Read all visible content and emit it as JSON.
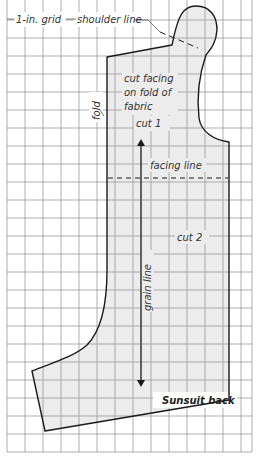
{
  "title": "Sunsuit back",
  "grid": {
    "label": "1-in. grid",
    "spacing_px": 18,
    "line_color": "#9a9a9a",
    "paper_color": "#ffffff"
  },
  "pattern_piece": {
    "fill_color": "#ececec",
    "outline_color": "#1a1a1a"
  },
  "labels": {
    "grid": "1-in. grid",
    "shoulder_line": "shoulder line",
    "cut_facing_line1": "cut facing",
    "cut_facing_line2": "on fold of",
    "cut_facing_line3": "fabric",
    "fold": "fold",
    "cut1": "cut 1",
    "facing_line": "facing line",
    "cut2": "cut 2",
    "grain_line": "grain line",
    "caption": "Sunsuit back"
  }
}
